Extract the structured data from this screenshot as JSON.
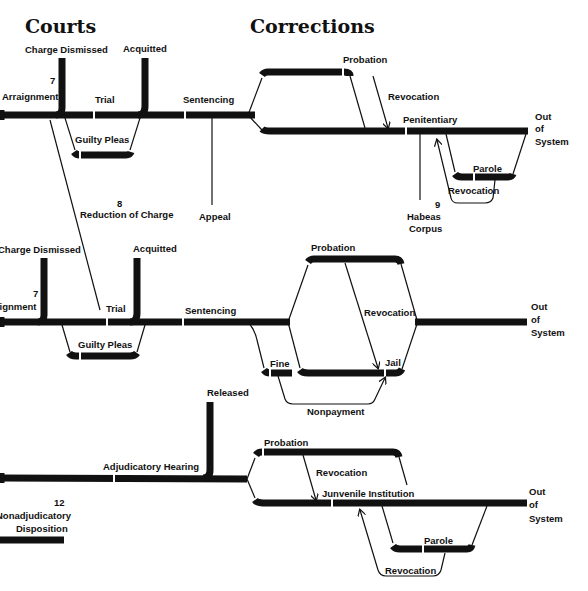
{
  "headings": {
    "courts": "Courts",
    "corrections": "Corrections"
  },
  "section1": {
    "charge_dismissed": "Charge Dismissed",
    "acquitted": "Acquitted",
    "arraignment_num": "7",
    "arraignment": "Arraignment",
    "trial": "Trial",
    "guilty_pleas": "Guilty Pleas",
    "sentencing": "Sentencing",
    "appeal": "Appeal",
    "reduction_num": "8",
    "reduction": "Reduction of Charge",
    "probation": "Probation",
    "revocation": "Revocation",
    "penitentiary": "Penitentiary",
    "parole": "Parole",
    "parole_revocation": "Revocation",
    "habeas_num": "9",
    "habeas_line1": "Habeas",
    "habeas_line2": "Corpus",
    "out_line1": "Out",
    "out_line2": "of",
    "out_line3": "System"
  },
  "section2": {
    "charge_dismissed": "Charge Dismissed",
    "acquitted": "Acquitted",
    "arraignment_num": "7",
    "arraignment": "Arraignment",
    "trial": "Trial",
    "guilty_pleas": "Guilty Pleas",
    "sentencing": "Sentencing",
    "probation": "Probation",
    "revocation": "Revocation",
    "fine": "Fine",
    "jail": "Jail",
    "nonpayment": "Nonpayment",
    "out_line1": "Out",
    "out_line2": "of",
    "out_line3": "System"
  },
  "section3": {
    "released": "Released",
    "adjudicatory_hearing": "Adjudicatory Hearing",
    "probation": "Probation",
    "revocation": "Revocation",
    "juvenile_institution": "Junvenile Institution",
    "parole": "Parole",
    "parole_revocation": "Revocation",
    "nonadj_num": "12",
    "nonadj_line1": "Nonadjudicatory",
    "nonadj_line2": "Disposition",
    "out_line1": "Out",
    "out_line2": "of",
    "out_line3": "System"
  }
}
